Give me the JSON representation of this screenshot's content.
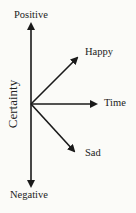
{
  "diagram": {
    "labels": {
      "top": "Positive",
      "bottom": "Negative",
      "vertical_axis": "Certainty",
      "up_right": "Happy",
      "right": "Time",
      "down_right": "Sad"
    },
    "colors": {
      "line": "#1a1a1a",
      "background": "#fbfbf8"
    }
  }
}
